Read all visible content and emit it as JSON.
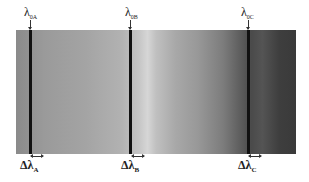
{
  "diagram": {
    "type": "spectral band with absorption lines",
    "band": {
      "gradient": [
        "#8a8a8a",
        "#d6d6d6",
        "#3a3a3a"
      ]
    },
    "lines": [
      {
        "id": "A",
        "top_symbol": "λ",
        "top_sub": "0A",
        "bottom_symbol": "Δλ",
        "bottom_sub": "A",
        "x": 29
      },
      {
        "id": "B",
        "top_symbol": "λ",
        "top_sub": "0B",
        "bottom_symbol": "Δλ",
        "bottom_sub": "B",
        "x": 129
      },
      {
        "id": "C",
        "top_symbol": "λ",
        "top_sub": "0C",
        "bottom_symbol": "Δλ",
        "bottom_sub": "C",
        "x": 247
      }
    ]
  }
}
